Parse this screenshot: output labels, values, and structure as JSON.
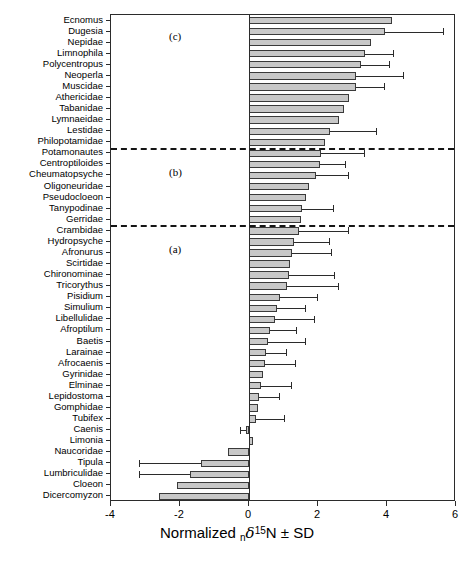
{
  "figure": {
    "panel_labels": [
      {
        "text": "(c)",
        "group": "c"
      },
      {
        "text": "(b)",
        "group": "b"
      },
      {
        "text": "(a)",
        "group": "a"
      }
    ],
    "axis_title_prefix": "Normalized ",
    "axis_title_sub": "n",
    "axis_title_delta": "δ",
    "axis_title_sup": "15",
    "axis_title_suffix": "N ± SD",
    "bar_fill": "#c8c8c8",
    "bar_stroke": "#3a3a3a"
  },
  "chart_data": {
    "type": "bar",
    "orientation": "horizontal",
    "title": "",
    "xlabel": "Normalized nδ15N ± SD",
    "ylabel": "",
    "xlim": [
      -4,
      6
    ],
    "xticks": [
      -4,
      -2,
      0,
      2,
      4,
      6
    ],
    "xticklabels": [
      "-4",
      "-2",
      "0",
      "2",
      "4",
      "6"
    ],
    "grid": false,
    "legend": false,
    "reference_lines": [
      {
        "value_after_index": 11,
        "style": "dashed",
        "note": "boundary between group (c) and group (b)"
      },
      {
        "value_after_index": 18,
        "style": "dashed",
        "note": "boundary between group (b) and group (a)"
      }
    ],
    "groups": [
      {
        "label": "(c)",
        "taxa_from": "Ecnomus",
        "taxa_to": "Philopotamidae"
      },
      {
        "label": "(b)",
        "taxa_from": "Potamonautes",
        "taxa_to": "Gerridae"
      },
      {
        "label": "(a)",
        "taxa_from": "Crambidae",
        "taxa_to": "Dicercomyzon"
      }
    ],
    "categories": [
      "Ecnomus",
      "Dugesia",
      "Nepidae",
      "Limnophila",
      "Polycentropus",
      "Neoperla",
      "Muscidae",
      "Athericidae",
      "Tabanidae",
      "Lymnaeidae",
      "Lestidae",
      "Philopotamidae",
      "Potamonautes",
      "Centroptiloides",
      "Cheumatopsyche",
      "Oligoneuridae",
      "Pseudocloeon",
      "Tanypodinae",
      "Gerridae",
      "Crambidae",
      "Hydropsyche",
      "Afronurus",
      "Scirtidae",
      "Chironominae",
      "Tricorythus",
      "Pisidium",
      "Simulium",
      "Libellulidae",
      "Afroptilum",
      "Baetis",
      "Larainae",
      "Afrocaenis",
      "Gyrinidae",
      "Elminae",
      "Lepidostoma",
      "Gomphidae",
      "Tubifex",
      "Caenis",
      "Limonia",
      "Naucoridae",
      "Tipula",
      "Lumbriculidae",
      "Cloeon",
      "Dicercomyzon"
    ],
    "values": [
      4.15,
      3.95,
      3.55,
      3.35,
      3.25,
      3.1,
      3.1,
      2.9,
      2.75,
      2.6,
      2.35,
      2.2,
      2.1,
      2.05,
      1.95,
      1.75,
      1.65,
      1.55,
      1.5,
      1.45,
      1.3,
      1.25,
      1.2,
      1.15,
      1.1,
      0.9,
      0.8,
      0.75,
      0.6,
      0.55,
      0.5,
      0.45,
      0.4,
      0.35,
      0.3,
      0.25,
      0.2,
      -0.1,
      0.12,
      -0.6,
      -1.4,
      -1.7,
      -2.1,
      -2.6
    ],
    "errors": [
      null,
      1.7,
      null,
      0.85,
      0.85,
      1.4,
      0.85,
      null,
      null,
      null,
      1.35,
      null,
      1.25,
      0.75,
      0.95,
      null,
      null,
      0.9,
      null,
      1.45,
      1.05,
      1.15,
      null,
      1.35,
      1.5,
      1.1,
      0.85,
      1.15,
      0.8,
      1.1,
      0.6,
      0.9,
      null,
      0.9,
      0.6,
      null,
      0.85,
      0.15,
      null,
      null,
      1.8,
      1.5,
      null,
      null
    ]
  }
}
